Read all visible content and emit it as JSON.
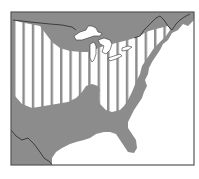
{
  "map": {
    "region": "Eastern United States",
    "colors": {
      "land": "#8c8c8c",
      "water": "#ffffff",
      "range_stripe_bg": "#ffffff",
      "range_stripe_line": "#8c8c8c",
      "border": "#2a2a2a",
      "frame": "#555555"
    },
    "legend": {
      "striped_area": "range",
      "solid_gray": "outside range"
    }
  }
}
